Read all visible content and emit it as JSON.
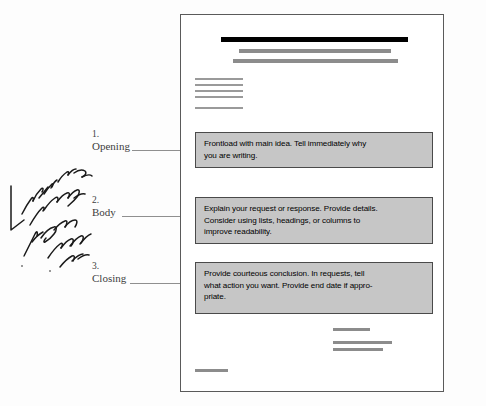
{
  "document": {
    "title_bar_label": "document-heading-bar",
    "page_background": "#ffffff",
    "page_border_color": "#5a5a5a",
    "box_fill_color": "#c6c6c6",
    "box_border_color": "#4a4a4a",
    "heading_bar_color": "#000000",
    "subheading_bar_color": "#8c8c8c",
    "rule_color": "#9a9a9a"
  },
  "callouts": [
    {
      "number": "1.",
      "name": "Opening"
    },
    {
      "number": "2.",
      "name": "Body"
    },
    {
      "number": "3.",
      "name": "Closing"
    }
  ],
  "boxes": [
    {
      "id": "opening",
      "lines": [
        "Frontload with main idea. Tell immediately why",
        "you are writing."
      ]
    },
    {
      "id": "body",
      "lines": [
        "Explain your request or response. Provide details.",
        "Consider using lists, headings, or columns to",
        "improve readability."
      ]
    },
    {
      "id": "closing",
      "lines": [
        "Provide courteous conclusion. In requests, tell",
        "what action you want. Provide end date if appro-",
        "priate."
      ]
    }
  ],
  "annotation": {
    "handwritten_note": "Don't make long You could...",
    "ink_color": "#1a1a1a"
  }
}
